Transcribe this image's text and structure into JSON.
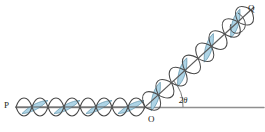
{
  "figure": {
    "type": "scattering-wave-diagram",
    "title": "",
    "canvas": {
      "width": 265,
      "height": 132,
      "background": "#ffffff"
    },
    "labels": {
      "start_point": "P",
      "origin_point": "O",
      "end_point": "Q",
      "angle": "2θ"
    },
    "colors": {
      "stroke": "#3b3b3b",
      "wave_stroke": "#4a4a4a",
      "fill": "#aed4e6",
      "fill_stroke": "#5a8aa0",
      "baseline": "#8a8a8a",
      "text": "#231f20"
    },
    "geometry": {
      "origin": {
        "x": 145,
        "y": 107
      },
      "baseline_y": 107,
      "baseline_x_start": 16,
      "baseline_x_end": 263,
      "incident_ray": {
        "x1": 16,
        "y1": 107,
        "x2": 145,
        "y2": 107
      },
      "scattered_ray": {
        "x1": 145,
        "y1": 107,
        "x2": 252,
        "y2": 9
      },
      "angle_degrees": 42,
      "angle_arc_radius": 38
    },
    "waves": {
      "incident": {
        "cycles": 4,
        "amplitude": 13,
        "wavelength": 32,
        "filled_lobes": [
          0,
          1,
          2,
          3
        ],
        "fill_pattern": "alternating-lens"
      },
      "scattered": {
        "cycles": 4,
        "amplitude": 15,
        "wavelength": 36,
        "filled_lobes": [
          0,
          1,
          2,
          3
        ],
        "fill_pattern": "alternating-lens"
      }
    }
  }
}
